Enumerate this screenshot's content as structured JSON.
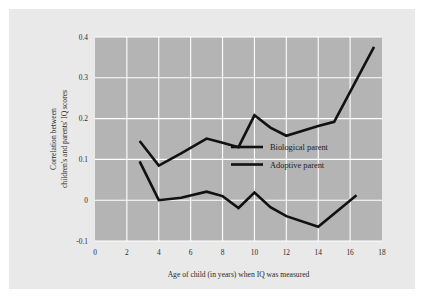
{
  "chart_data": {
    "type": "line",
    "title": "",
    "xlabel": "Age of child (in years) when IQ was measured",
    "ylabel_line1": "Correlation between",
    "ylabel_line2": "children's and parents' IQ scores",
    "xlim": [
      0,
      18
    ],
    "ylim": [
      -0.1,
      0.4
    ],
    "xticks": [
      "0",
      "2",
      "4",
      "6",
      "8",
      "10",
      "12",
      "14",
      "16",
      "18"
    ],
    "xtick_values": [
      0,
      2,
      4,
      6,
      8,
      10,
      12,
      14,
      16,
      18
    ],
    "yticks": [
      "0.4",
      "0.3",
      "0.2",
      "0.1",
      "0",
      "-0.1"
    ],
    "ytick_values": [
      0.4,
      0.3,
      0.2,
      0.1,
      0,
      -0.1
    ],
    "grid": true,
    "grid_color": "#ffffff",
    "plot_background": "#b4b4b4",
    "line_color": "#111111",
    "legend_position": "center-right",
    "series": [
      {
        "name": "Biological parent",
        "x": [
          2.8,
          4.0,
          5.4,
          7.0,
          8.0,
          9.0,
          10.0,
          11.0,
          12.0,
          14.0,
          15.0,
          17.5
        ],
        "values": [
          0.145,
          0.085,
          0.115,
          0.151,
          0.141,
          0.13,
          0.208,
          0.178,
          0.158,
          0.182,
          0.192,
          0.376
        ]
      },
      {
        "name": "Adoptive parent",
        "x": [
          2.8,
          4.0,
          5.4,
          7.0,
          8.0,
          9.0,
          10.0,
          11.0,
          12.0,
          14.0,
          16.4
        ],
        "values": [
          0.095,
          0.0,
          0.006,
          0.021,
          0.01,
          -0.019,
          0.019,
          -0.017,
          -0.039,
          -0.065,
          0.012
        ]
      }
    ],
    "legend": [
      {
        "label": "Biological parent"
      },
      {
        "label": "Adoptive parent"
      }
    ]
  }
}
